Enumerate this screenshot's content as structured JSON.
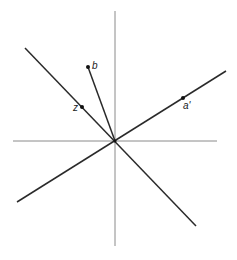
{
  "diagram": {
    "labels": {
      "b": "b",
      "z": "z",
      "a_prime": "a'"
    },
    "origin": {
      "x": 115,
      "y": 141
    },
    "axes": {
      "vertical": {
        "x1": 115,
        "y1": 11,
        "x2": 115,
        "y2": 246
      },
      "horizontal": {
        "x1": 13,
        "y1": 141,
        "x2": 217,
        "y2": 141
      }
    },
    "lines": [
      {
        "name": "line-through-z",
        "x1": 25,
        "y1": 48,
        "x2": 196,
        "y2": 226
      },
      {
        "name": "line-through-a-prime",
        "x1": 17,
        "y1": 202,
        "x2": 226,
        "y2": 71
      },
      {
        "name": "segment-to-b",
        "x1": 115,
        "y1": 141,
        "x2": 88,
        "y2": 67
      }
    ],
    "points": [
      {
        "name": "b",
        "x": 88,
        "y": 67
      },
      {
        "name": "z",
        "x": 82,
        "y": 107
      },
      {
        "name": "a_prime",
        "x": 183,
        "y": 98
      }
    ],
    "colors": {
      "axis": "#8a8a8a",
      "line": "#2a2a2a",
      "background": "#ffffff"
    }
  }
}
